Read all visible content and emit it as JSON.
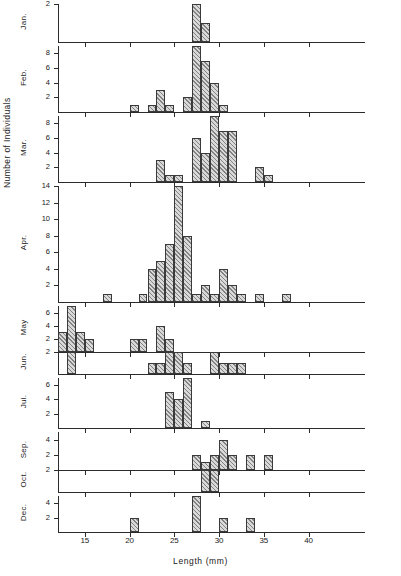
{
  "figure": {
    "ylabel": "Number of Individuals",
    "xlabel": "Length  (mm)",
    "bin_width_mm": 1,
    "x_axis": {
      "min": 12,
      "max": 43,
      "ticks": [
        15,
        20,
        25,
        30,
        35,
        40
      ],
      "tick_labels": [
        "15",
        "20",
        "25",
        "30",
        "35",
        "40"
      ]
    }
  },
  "chart_data": {
    "type": "bar",
    "title": "",
    "xlabel": "Length  (mm)",
    "ylabel": "Number of Individuals",
    "xlim": [
      12,
      43
    ],
    "grid": false,
    "legend": "none",
    "note": "Stacked monthly length-frequency histograms; x = length in mm (1 mm bins), y = number of individuals",
    "panels": [
      {
        "name": "Jan.",
        "label": "Jan.",
        "ylim": [
          0,
          2
        ],
        "yticks": [
          2
        ],
        "ytick_labels": [
          "2"
        ],
        "bins": [
          27,
          28
        ],
        "values": [
          2,
          1
        ]
      },
      {
        "name": "Feb.",
        "label": "Feb.",
        "ylim": [
          0,
          9
        ],
        "yticks": [
          2,
          4,
          6,
          8
        ],
        "ytick_labels": [
          "2",
          "4",
          "6",
          "8"
        ],
        "bins": [
          20,
          22,
          23,
          24,
          26,
          27,
          28,
          29,
          30
        ],
        "values": [
          1,
          1,
          3,
          1,
          2,
          9,
          7,
          4,
          1
        ]
      },
      {
        "name": "Mar.",
        "label": "Mar.",
        "ylim": [
          0,
          9
        ],
        "yticks": [
          2,
          4,
          6,
          8
        ],
        "ytick_labels": [
          "2",
          "4",
          "6",
          "8"
        ],
        "bins": [
          23,
          24,
          25,
          27,
          28,
          29,
          30,
          31,
          34,
          35
        ],
        "values": [
          3,
          1,
          1,
          6,
          4,
          9,
          7,
          7,
          2,
          1
        ]
      },
      {
        "name": "Apr.",
        "label": "Apr.",
        "ylim": [
          0,
          14
        ],
        "yticks": [
          2,
          4,
          6,
          8,
          10,
          12,
          14
        ],
        "ytick_labels": [
          "2",
          "4",
          "6",
          "8",
          "10",
          "12",
          "14"
        ],
        "bins": [
          17,
          21,
          22,
          23,
          24,
          25,
          26,
          27,
          28,
          29,
          30,
          31,
          32,
          34,
          37
        ],
        "values": [
          1,
          1,
          4,
          5,
          7,
          14,
          8,
          1,
          2,
          1,
          4,
          2,
          1,
          1,
          1
        ]
      },
      {
        "name": "May",
        "label": "May",
        "ylim": [
          0,
          7
        ],
        "yticks": [
          2,
          4,
          6
        ],
        "ytick_labels": [
          "2",
          "4",
          "6"
        ],
        "bins": [
          12,
          13,
          14,
          15,
          20,
          21,
          23,
          24
        ],
        "values": [
          3,
          7,
          3,
          2,
          2,
          2,
          4,
          2
        ]
      },
      {
        "name": "Jun.",
        "label": "Jun.",
        "ylim": [
          0,
          2
        ],
        "yticks": [
          2
        ],
        "ytick_labels": [
          "2"
        ],
        "bins": [
          13,
          22,
          23,
          24,
          25,
          26,
          29,
          30,
          31,
          32
        ],
        "values": [
          2,
          1,
          1,
          2,
          2,
          1,
          2,
          1,
          1,
          1
        ]
      },
      {
        "name": "Jul.",
        "label": "Jul.",
        "ylim": [
          0,
          7
        ],
        "yticks": [
          2,
          4,
          6
        ],
        "ytick_labels": [
          "2",
          "4",
          "6"
        ],
        "bins": [
          24,
          25,
          26,
          28
        ],
        "values": [
          5,
          4,
          7,
          1
        ]
      },
      {
        "name": "Sep.",
        "label": "Sep.",
        "ylim": [
          0,
          5
        ],
        "yticks": [
          2,
          4
        ],
        "ytick_labels": [
          "2",
          "4"
        ],
        "bins": [
          27,
          28,
          29,
          30,
          31,
          33,
          35
        ],
        "values": [
          2,
          1,
          2,
          4,
          2,
          2,
          2
        ]
      },
      {
        "name": "Oct.",
        "label": "Oct.",
        "ylim": [
          0,
          2
        ],
        "yticks": [
          2
        ],
        "ytick_labels": [
          "2"
        ],
        "bins": [
          28,
          29
        ],
        "values": [
          2,
          2
        ]
      },
      {
        "name": "Dec.",
        "label": "Dec.",
        "ylim": [
          0,
          5
        ],
        "yticks": [
          2,
          4
        ],
        "ytick_labels": [
          "2",
          "4"
        ],
        "bins": [
          20,
          27,
          30,
          33
        ],
        "values": [
          2,
          5,
          2,
          2
        ]
      }
    ]
  }
}
